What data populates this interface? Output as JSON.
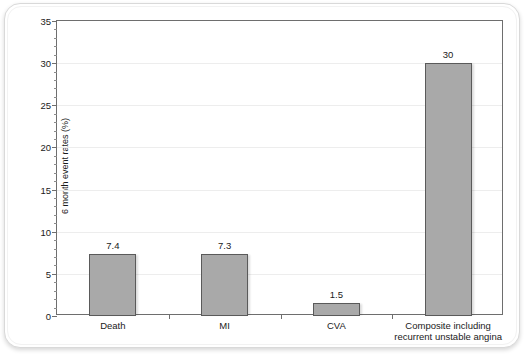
{
  "chart_data": {
    "type": "bar",
    "title": "",
    "xlabel": "",
    "ylabel": "6 month event rates (%)",
    "categories": [
      "Death",
      "MI",
      "CVA",
      "Composite including recurrent unstable angina"
    ],
    "category_lines": [
      [
        "Death"
      ],
      [
        "MI"
      ],
      [
        "CVA"
      ],
      [
        "Composite including",
        "recurrent unstable angina"
      ]
    ],
    "values": [
      7.4,
      7.3,
      1.5,
      30
    ],
    "value_labels": [
      "7.4",
      "7.3",
      "1.5",
      "30"
    ],
    "ylim": [
      0,
      35
    ],
    "ytick_values": [
      0,
      5,
      10,
      15,
      20,
      25,
      30,
      35
    ],
    "ytick_labels": [
      "0",
      "5",
      "10",
      "15",
      "20",
      "25",
      "30",
      "35"
    ],
    "ytick_minor_step": 1,
    "grid": "horizontal-major",
    "legend": "none",
    "colors": {
      "bar_fill": "#a9a9a9",
      "bar_border": "#5a5a5a",
      "axis": "#6e6e6e",
      "grid": "#ededed",
      "text": "#1a1a1a",
      "background": "#ffffff",
      "page_border": "#d9d9d9"
    }
  }
}
